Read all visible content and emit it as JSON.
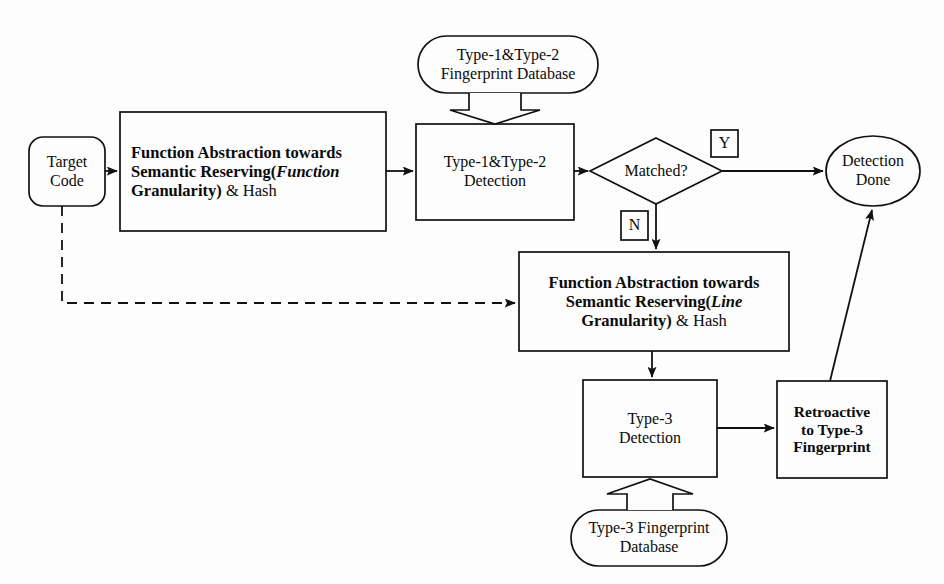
{
  "diagram": {
    "type": "flowchart",
    "background_color": "#fdfdfd",
    "stroke_color": "#111111",
    "nodes": {
      "target_code": {
        "label_line1": "Target",
        "label_line2": "Code",
        "shape": "rounded-rectangle"
      },
      "func_abstraction_function": {
        "line1": "Function Abstraction towards",
        "line2_a": "Semantic Reserving(",
        "line2_b": "Function",
        "line3_a": "Granularity)",
        "line3_b": "& Hash",
        "shape": "rectangle"
      },
      "type12_database": {
        "line1": "Type-1&Type-2",
        "line2": "Fingerprint Database",
        "shape": "stadium"
      },
      "type12_detection": {
        "line1": "Type-1&Type-2",
        "line2": "Detection",
        "shape": "rectangle"
      },
      "matched_decision": {
        "label": "Matched?",
        "shape": "diamond"
      },
      "yes_label": {
        "label": "Y"
      },
      "no_label": {
        "label": "N"
      },
      "detection_done": {
        "line1": "Detection",
        "line2": "Done",
        "shape": "ellipse"
      },
      "func_abstraction_line": {
        "line1": "Function Abstraction towards",
        "line2_a": "Semantic Reserving(",
        "line2_b": "Line",
        "line3_a": "Granularity)",
        "line3_b": "& Hash",
        "shape": "rectangle"
      },
      "type3_detection": {
        "line1": "Type-3",
        "line2": "Detection",
        "shape": "rectangle"
      },
      "retroactive": {
        "line1": "Retroactive",
        "line2": "to Type-3",
        "line3": "Fingerprint",
        "shape": "rectangle"
      },
      "type3_database": {
        "line1": "Type-3 Fingerprint",
        "line2": "Database",
        "shape": "stadium"
      }
    },
    "edges": [
      {
        "name": "target-code-to-function-abstraction",
        "style": "solid-arrow"
      },
      {
        "name": "target-code-to-line-abstraction",
        "style": "dashed-arrow"
      },
      {
        "name": "function-abstraction-to-type12-detection",
        "style": "solid-arrow"
      },
      {
        "name": "type12-database-to-type12-detection",
        "style": "hollow-block-arrow-down"
      },
      {
        "name": "type12-detection-to-matched",
        "style": "solid-arrow"
      },
      {
        "name": "matched-yes-to-detection-done",
        "style": "solid-arrow"
      },
      {
        "name": "matched-no-to-line-abstraction",
        "style": "solid-arrow"
      },
      {
        "name": "line-abstraction-to-type3-detection",
        "style": "solid-arrow"
      },
      {
        "name": "type3-database-to-type3-detection",
        "style": "hollow-block-arrow-up"
      },
      {
        "name": "type3-detection-to-retroactive",
        "style": "solid-arrow"
      },
      {
        "name": "retroactive-to-detection-done",
        "style": "solid-arrow-diagonal"
      }
    ]
  }
}
